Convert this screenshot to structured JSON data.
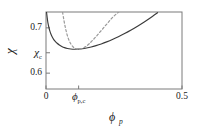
{
  "figure": {
    "background_color": "#ffffff",
    "frame_color": "#7a7a7a",
    "solid_curve_color": "#3b3b3b",
    "dashed_curve_color": "#9a9a9a"
  },
  "chart_data": {
    "type": "line",
    "title": "",
    "subtitle": "",
    "xlabel": "ϕp",
    "ylabel": "χ",
    "xlabel_parts": {
      "base": "ϕ",
      "sub": "p"
    },
    "ylabel_parts": {
      "base": "χ",
      "sub": ""
    },
    "xlim": [
      0,
      0.5
    ],
    "ylim": [
      0.565,
      0.735
    ],
    "grid": false,
    "legend": "none",
    "x_ticks": [
      {
        "value": 0,
        "label": "0",
        "label_base": "0",
        "label_sub": ""
      },
      {
        "value": 0.12,
        "label": "ϕp,c",
        "label_base": "ϕ",
        "label_sub": "p,c"
      },
      {
        "value": 0.5,
        "label": "0.5",
        "label_base": "0.5",
        "label_sub": ""
      }
    ],
    "y_ticks": [
      {
        "value": 0.7,
        "label": "0.7",
        "label_base": "0.7",
        "label_sub": ""
      },
      {
        "value": 0.645,
        "label": "χc",
        "label_base": "χ",
        "label_sub": "c"
      },
      {
        "value": 0.6,
        "label": "0.6",
        "label_base": "0.6",
        "label_sub": ""
      }
    ],
    "annotations": [],
    "series": [
      {
        "name": "solid-curve",
        "style": "solid",
        "color": "#3b3b3b",
        "x": [
          0.002,
          0.004,
          0.006,
          0.008,
          0.011,
          0.014,
          0.018,
          0.023,
          0.028,
          0.034,
          0.041,
          0.049,
          0.058,
          0.068,
          0.079,
          0.091,
          0.104,
          0.118,
          0.133,
          0.149,
          0.166,
          0.184,
          0.203,
          0.223,
          0.244,
          0.266,
          0.289,
          0.313,
          0.338,
          0.364,
          0.391,
          0.41
        ],
        "y": [
          0.7345,
          0.7245,
          0.7152,
          0.7082,
          0.7002,
          0.6935,
          0.6866,
          0.6799,
          0.6746,
          0.67,
          0.6659,
          0.6622,
          0.659,
          0.6563,
          0.6544,
          0.6533,
          0.6528,
          0.653,
          0.6539,
          0.6555,
          0.6578,
          0.6608,
          0.6645,
          0.669,
          0.6743,
          0.6805,
          0.6875,
          0.6954,
          0.7043,
          0.7142,
          0.7252,
          0.7335
        ]
      },
      {
        "name": "dashed-curve",
        "style": "dashed",
        "color": "#9a9a9a",
        "x": [
          0.061,
          0.065,
          0.07,
          0.076,
          0.083,
          0.091,
          0.1,
          0.11,
          0.121,
          0.133,
          0.146,
          0.16,
          0.175,
          0.191,
          0.208,
          0.226,
          0.245,
          0.265,
          0.286,
          0.3
        ],
        "y": [
          0.7345,
          0.72,
          0.704,
          0.6885,
          0.675,
          0.6648,
          0.6578,
          0.6538,
          0.6527,
          0.6543,
          0.6586,
          0.6655,
          0.6747,
          0.6855,
          0.6975,
          0.7102,
          0.7232,
          0.734,
          0.743,
          0.747
        ]
      }
    ]
  }
}
